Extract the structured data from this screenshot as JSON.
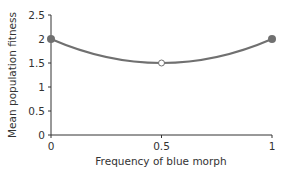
{
  "chart_data": {
    "type": "line",
    "title": "",
    "xlabel": "Frequency of blue morph",
    "ylabel": "Mean population fitness",
    "xlim": [
      0,
      1
    ],
    "ylim": [
      0,
      2.5
    ],
    "x_ticks": [
      "0",
      "0.5",
      "1"
    ],
    "y_ticks": [
      "0",
      "0.5",
      "1",
      "1.5",
      "2",
      "2.5"
    ],
    "grid": false,
    "legend": null,
    "series": [
      {
        "name": "Mean population fitness",
        "curve": "smooth (parabolic, minimum at 0.5)",
        "x": [
          0,
          0.25,
          0.5,
          0.75,
          1
        ],
        "values": [
          2,
          1.625,
          1.5,
          1.625,
          2
        ]
      }
    ],
    "markers": [
      {
        "x": 0,
        "y": 2,
        "style": "filled"
      },
      {
        "x": 0.5,
        "y": 1.5,
        "style": "open"
      },
      {
        "x": 1,
        "y": 2,
        "style": "filled"
      }
    ],
    "colors": {
      "line": "#707070",
      "marker_fill": "#707070",
      "open_marker_fill": "#ffffff",
      "axis": "#333333"
    }
  }
}
